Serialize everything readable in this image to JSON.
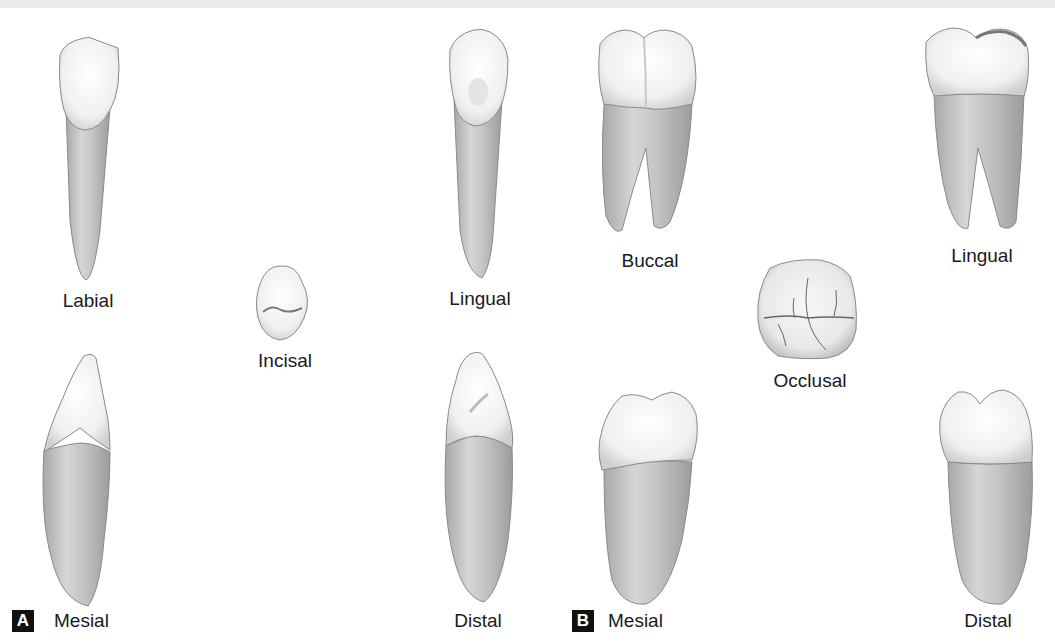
{
  "figure": {
    "panels": [
      {
        "id": "A",
        "badge": "A",
        "tooth_type": "anterior (incisor/canine)",
        "views": {
          "labial": "Labial",
          "incisal": "Incisal",
          "lingual": "Lingual",
          "mesial": "Mesial",
          "distal": "Distal"
        }
      },
      {
        "id": "B",
        "badge": "B",
        "tooth_type": "molar",
        "views": {
          "buccal": "Buccal",
          "occlusal": "Occlusal",
          "lingual": "Lingual",
          "mesial": "Mesial",
          "distal": "Distal"
        }
      }
    ],
    "colors": {
      "crown": "#f4f4f4",
      "root": "#c9c9c9",
      "outline": "#8a8a8a",
      "badge_bg": "#111111",
      "badge_text": "#ffffff"
    }
  }
}
